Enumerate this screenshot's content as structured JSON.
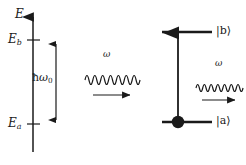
{
  "figure": {
    "type": "energy-level-diagram",
    "title_visible": false,
    "background": "#ffffff",
    "ink": "#1a1a1a"
  },
  "axis": {
    "name": "energy-axis",
    "label": "E",
    "orientation": "vertical",
    "arrow_head": "up",
    "x": 33,
    "top_y": 16,
    "bottom_y": 152,
    "ticks": [
      {
        "id": "eb",
        "label_base": "E",
        "label_sub": "b",
        "y": 40
      },
      {
        "id": "ea",
        "label_base": "E",
        "label_sub": "a",
        "y": 124
      }
    ]
  },
  "transition_gap": {
    "name": "hbar-omega-zero-arrow",
    "label_hbar": "ħ",
    "label_omega": "ω",
    "label_sub": "0",
    "label_full": "ħω₀",
    "x": 56,
    "top_y": 40,
    "bottom_y": 124,
    "double_headed": true
  },
  "levels": [
    {
      "id": "level-b",
      "name": "upper-level",
      "ket": "|b⟩",
      "ket_base": "b",
      "x1": 162,
      "x2": 212,
      "y": 32,
      "occupied": false,
      "label_x": 216
    },
    {
      "id": "level-a",
      "name": "lower-level",
      "ket": "|a⟩",
      "ket_base": "a",
      "x1": 162,
      "x2": 212,
      "y": 122,
      "occupied": true,
      "electron_x": 178,
      "label_x": 216
    }
  ],
  "vertical_transition": {
    "name": "absorption-arrow",
    "x": 178,
    "from_y": 122,
    "to_y": 32,
    "direction": "up"
  },
  "waves": [
    {
      "id": "wave-in",
      "name": "incoming-photon-wave",
      "label": "ω",
      "label_x": 106,
      "label_y": 55,
      "x1": 85,
      "x2": 140,
      "y": 80,
      "cycles": 7,
      "amplitude": 9,
      "propagation_arrow": {
        "x1": 93,
        "x2": 131,
        "y": 95,
        "direction": "right"
      }
    },
    {
      "id": "wave-out",
      "name": "outgoing-photon-wave",
      "label": "ω",
      "label_x": 218,
      "label_y": 64,
      "x1": 196,
      "x2": 243,
      "y": 88,
      "cycles": 7,
      "amplitude": 7,
      "propagation_arrow": {
        "x1": 202,
        "x2": 236,
        "y": 100,
        "direction": "right"
      }
    }
  ],
  "fonts": {
    "axis_label_size": "12px",
    "ket_label_size": "11px",
    "wave_label_size": "9px",
    "gap_label_size": "10px"
  }
}
